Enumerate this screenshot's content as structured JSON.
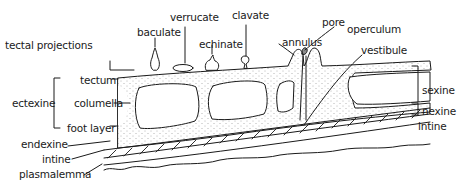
{
  "diagram": {
    "line_color": "#1a1a1a",
    "background": "#ffffff",
    "stipple_color": "#555555",
    "labels": {
      "tectal_projections": "tectal projections",
      "baculate": "baculate",
      "verrucate": "verrucate",
      "echinate": "echinate",
      "clavate": "clavate",
      "pore": "pore",
      "annulus": "annulus",
      "operculum": "operculum",
      "vestibule": "vestibule",
      "tectum": "tectum",
      "ectexine": "ectexine",
      "columella": "columella",
      "foot_layer": "foot layer",
      "endexine": "endexine",
      "intine_left": "intine",
      "plasmalemma": "plasmalemma",
      "sexine": "sexine",
      "nexine": "nexine",
      "intine_right": "intine"
    }
  }
}
